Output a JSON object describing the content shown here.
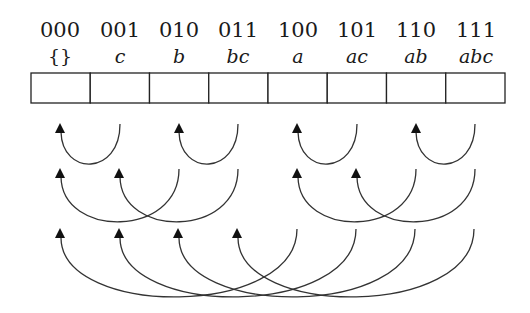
{
  "cells": [
    {
      "bits": "000",
      "set": "{}"
    },
    {
      "bits": "001",
      "set": "c"
    },
    {
      "bits": "010",
      "set": "b"
    },
    {
      "bits": "011",
      "set": "bc"
    },
    {
      "bits": "100",
      "set": "a"
    },
    {
      "bits": "101",
      "set": "ac"
    },
    {
      "bits": "110",
      "set": "ab"
    },
    {
      "bits": "111",
      "set": "abc"
    }
  ],
  "arc_rows": [
    {
      "row": 1,
      "step": 1,
      "arcs": [
        {
          "from": "001",
          "to": "000"
        },
        {
          "from": "011",
          "to": "010"
        },
        {
          "from": "101",
          "to": "100"
        },
        {
          "from": "111",
          "to": "110"
        }
      ]
    },
    {
      "row": 2,
      "step": 2,
      "arcs": [
        {
          "from": "010",
          "to": "000"
        },
        {
          "from": "011",
          "to": "001"
        },
        {
          "from": "110",
          "to": "100"
        },
        {
          "from": "111",
          "to": "101"
        }
      ]
    },
    {
      "row": 3,
      "step": 4,
      "arcs": [
        {
          "from": "100",
          "to": "000"
        },
        {
          "from": "101",
          "to": "001"
        },
        {
          "from": "110",
          "to": "010"
        },
        {
          "from": "111",
          "to": "011"
        }
      ]
    }
  ]
}
